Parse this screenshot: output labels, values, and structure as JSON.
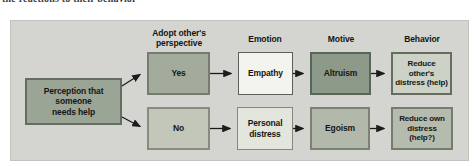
{
  "page_text_fragment": "the reactions to their behavior",
  "diagram": {
    "headers": [
      {
        "id": "adopt-perspective",
        "label": "Adopt other's\nperspective"
      },
      {
        "id": "emotion",
        "label": "Emotion"
      },
      {
        "id": "motive",
        "label": "Motive"
      },
      {
        "id": "behavior",
        "label": "Behavior"
      }
    ],
    "nodes": {
      "perception": {
        "label": "Perception that someone\nneeds help"
      },
      "yes": {
        "label": "Yes"
      },
      "no": {
        "label": "No"
      },
      "empathy": {
        "label": "Empathy"
      },
      "personal_distress": {
        "label": "Personal\ndistress"
      },
      "altruism": {
        "label": "Altruism"
      },
      "egoism": {
        "label": "Egoism"
      },
      "reduce_others": {
        "label": "Reduce other's\ndistress (help)"
      },
      "reduce_own": {
        "label": "Reduce own\ndistress (help?)"
      }
    },
    "colors": {
      "panel_bg": "#d4d5d0",
      "arrow": "#1c1c1c",
      "perception_fill": "#9ba596",
      "perception_border": "#646e60",
      "yes_fill": "#a3ac9c",
      "yes_border": "#737c6d",
      "no_fill": "#c2c7ba",
      "no_border": "#878d7e",
      "empathy_fill": "#f3f4ee",
      "empathy_border": "#5d5f58",
      "personal_fill": "#e3e6dc",
      "personal_border": "#85897c",
      "altruism_fill": "#8d9a8a",
      "altruism_border": "#59655a",
      "egoism_fill": "#b2b9aa",
      "egoism_border": "#7b8273",
      "reduce_others_fill": "#ccd2c5",
      "reduce_others_border": "#666d60",
      "reduce_own_fill": "#b5bcae",
      "reduce_own_border": "#757c6e"
    }
  }
}
